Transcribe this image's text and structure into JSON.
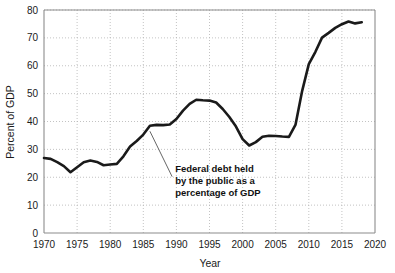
{
  "chart_data": {
    "type": "line",
    "title": "",
    "xlabel": "Year",
    "ylabel": "Percent of GDP",
    "xlim": [
      1970,
      2020
    ],
    "ylim": [
      0,
      80
    ],
    "grid": true,
    "legend": "none",
    "xticks": [
      1970,
      1975,
      1980,
      1985,
      1990,
      1995,
      2000,
      2005,
      2010,
      2015,
      2020
    ],
    "yticks": [
      0,
      10,
      20,
      30,
      40,
      50,
      60,
      70,
      80
    ],
    "xtick_labels": [
      "1970",
      "1975",
      "1980",
      "1985",
      "1990",
      "1995",
      "2000",
      "2005",
      "2010",
      "2015",
      "2020"
    ],
    "ytick_labels": [
      "0",
      "10",
      "20",
      "30",
      "40",
      "50",
      "60",
      "70",
      "80"
    ],
    "line_color": "#1a1a1a",
    "grid_color": "#b4b4b4",
    "axis_color": "#8c8c8c",
    "series": [
      {
        "name": "Federal debt held by the public as a percentage of GDP",
        "x": [
          1970,
          1971,
          1972,
          1973,
          1974,
          1975,
          1976,
          1977,
          1978,
          1979,
          1980,
          1981,
          1982,
          1983,
          1984,
          1985,
          1986,
          1987,
          1988,
          1989,
          1990,
          1991,
          1992,
          1993,
          1994,
          1995,
          1996,
          1997,
          1998,
          1999,
          2000,
          2001,
          2002,
          2003,
          2004,
          2005,
          2006,
          2007,
          2008,
          2009,
          2010,
          2011,
          2012,
          2013,
          2014,
          2015,
          2016,
          2017,
          2018
        ],
        "values": [
          26.9,
          26.6,
          25.4,
          24.0,
          21.8,
          23.6,
          25.4,
          26.0,
          25.5,
          24.3,
          24.6,
          24.8,
          27.5,
          31.0,
          33.0,
          35.3,
          38.5,
          38.8,
          38.7,
          38.9,
          40.9,
          43.9,
          46.3,
          47.8,
          47.6,
          47.5,
          46.8,
          44.5,
          41.6,
          38.2,
          33.7,
          31.4,
          32.6,
          34.5,
          34.9,
          34.8,
          34.6,
          34.5,
          38.9,
          51.0,
          60.6,
          65.0,
          70.1,
          71.8,
          73.6,
          74.9,
          75.9,
          75.2,
          75.6
        ]
      }
    ],
    "annotations": [
      {
        "text_lines": [
          "Federal debt held",
          "by the public as a",
          "percentage of GDP"
        ],
        "point_x": 1986,
        "point_y": 36.5,
        "label_x": 1988.6,
        "label_y": 22.0
      }
    ]
  }
}
